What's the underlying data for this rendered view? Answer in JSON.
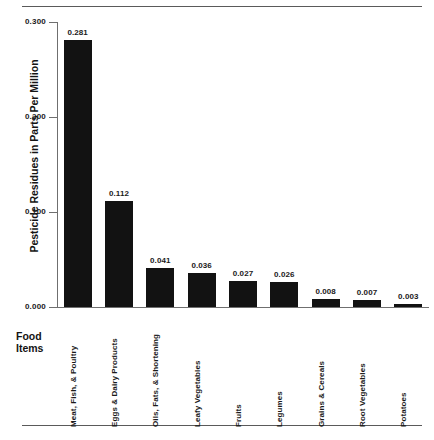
{
  "chart_data": {
    "type": "bar",
    "title": "",
    "xlabel": "Food Items",
    "ylabel": "Pesticide Residues in Parts Per Million",
    "categories": [
      "Meat, Fish, & Poultry",
      "Eggs & Dairy Products",
      "Oils, Fats, & Shortening",
      "Leafy Vegetables",
      "Fruits",
      "Legumes",
      "Grains & Cereals",
      "Root Vegetables",
      "Potatoes"
    ],
    "values": [
      0.281,
      0.112,
      0.041,
      0.036,
      0.027,
      0.026,
      0.008,
      0.007,
      0.003
    ],
    "value_labels": [
      "0.281",
      "0.112",
      "0.041",
      "0.036",
      "0.027",
      "0.026",
      "0.008",
      "0.007",
      "0.003"
    ],
    "ylim": [
      0.0,
      0.3
    ],
    "yticks": [
      0.0,
      0.1,
      0.2,
      0.3
    ],
    "ytick_labels": [
      "0.000",
      "0.100",
      "0.200",
      "0.300"
    ],
    "grid": false,
    "legend": null,
    "bar_color": "#121212",
    "axis_color": "#6f6f6f",
    "text_color": "#1a1a1a",
    "rule_color": "#5a5a5a"
  }
}
